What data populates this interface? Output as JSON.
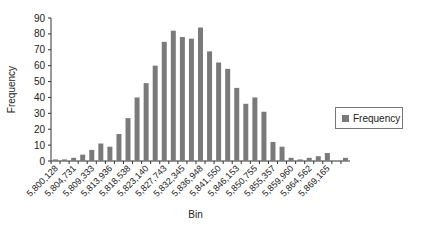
{
  "chart_data": {
    "type": "bar",
    "title": "",
    "xlabel": "Bin",
    "ylabel": "Frequency",
    "ylim": [
      0,
      90
    ],
    "yticks": [
      0,
      10,
      20,
      30,
      40,
      50,
      60,
      70,
      80,
      90
    ],
    "grid": false,
    "legend_position": "right",
    "bar_color": "#7a7a7a",
    "x_tick_labels": [
      "5,800,128",
      "5,804,731",
      "5,809,333",
      "5,813,936",
      "5,818,538",
      "5,823,140",
      "5,827,743",
      "5,832,345",
      "5,836,948",
      "5,841,550",
      "5,846,153",
      "5,850,755",
      "5,855,357",
      "5,859,960",
      "5,864,562",
      "5,869,165"
    ],
    "series": [
      {
        "name": "Frequency",
        "values": [
          1,
          1,
          2,
          4,
          7,
          11,
          9,
          17,
          27,
          40,
          49,
          60,
          75,
          82,
          78,
          77,
          84,
          69,
          62,
          58,
          46,
          36,
          40,
          31,
          12,
          9,
          2,
          1,
          2,
          3,
          5,
          0,
          2
        ]
      }
    ]
  },
  "legend": {
    "label": "Frequency"
  }
}
